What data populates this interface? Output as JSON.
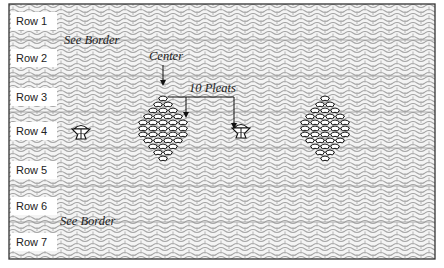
{
  "diagram": {
    "rows": [
      {
        "label": "Row 1",
        "y": 12
      },
      {
        "label": "Row 2",
        "y": 49
      },
      {
        "label": "Row 3",
        "y": 88
      },
      {
        "label": "Row 4",
        "y": 122
      },
      {
        "label": "Row 5",
        "y": 161
      },
      {
        "label": "Row 6",
        "y": 197
      },
      {
        "label": "Row 7",
        "y": 233
      }
    ],
    "annotations": {
      "see_border_top": "See Border",
      "see_border_bottom": "See Border",
      "center": "Center",
      "pleats": "10 Pleats"
    },
    "colors": {
      "pattern": "#a8a8a8",
      "frame": "#333333",
      "motif": "#111111",
      "background": "#ffffff"
    }
  }
}
